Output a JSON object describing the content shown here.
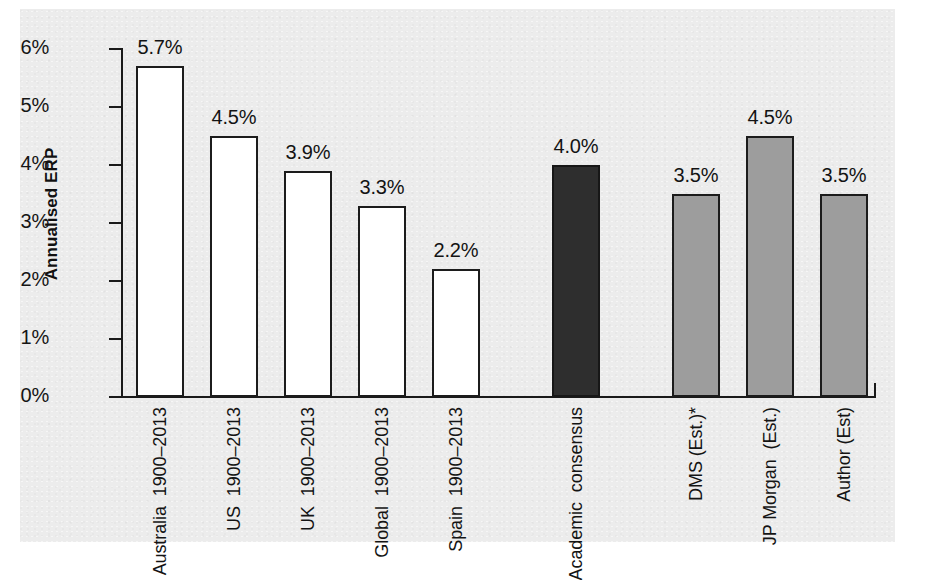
{
  "chart_data": {
    "type": "bar",
    "title": "",
    "subtitle": "",
    "xlabel": "",
    "ylabel": "Annualised ERP",
    "ylim": [
      0,
      6
    ],
    "yticks": [
      "0%",
      "1%",
      "2%",
      "3%",
      "4%",
      "5%",
      "6%"
    ],
    "ytick_values": [
      0,
      1,
      2,
      3,
      4,
      5,
      6
    ],
    "grid": false,
    "legend": "none",
    "units": "percent",
    "categories": [
      "Australia 1900–2013",
      "US 1900–2013",
      "UK 1900–2013",
      "Global 1900–2013",
      "Spain 1900–2013",
      "Academic consensus",
      "DMS (Est.)*",
      "JP Morgan (Est.)",
      "Author (Est)"
    ],
    "values": [
      5.7,
      4.5,
      3.9,
      3.3,
      2.2,
      4.0,
      3.5,
      4.5,
      3.5
    ],
    "data_labels": [
      "5.7%",
      "4.5%",
      "3.9%",
      "3.3%",
      "2.2%",
      "4.0%",
      "3.5%",
      "4.5%",
      "3.5%"
    ],
    "bars": [
      {
        "id": "australia",
        "label_lines": [
          "Australia",
          "1900–2013"
        ],
        "value": 5.7,
        "value_label": "5.7%",
        "style": "open",
        "group": "historical"
      },
      {
        "id": "us",
        "label_lines": [
          "US",
          "1900–2013"
        ],
        "value": 4.5,
        "value_label": "4.5%",
        "style": "open",
        "group": "historical"
      },
      {
        "id": "uk",
        "label_lines": [
          "UK",
          "1900–2013"
        ],
        "value": 3.9,
        "value_label": "3.9%",
        "style": "open",
        "group": "historical"
      },
      {
        "id": "global",
        "label_lines": [
          "Global",
          "1900–2013"
        ],
        "value": 3.3,
        "value_label": "3.3%",
        "style": "open",
        "group": "historical"
      },
      {
        "id": "spain",
        "label_lines": [
          "Spain",
          "1900–2013"
        ],
        "value": 2.2,
        "value_label": "2.2%",
        "style": "open",
        "group": "historical"
      },
      {
        "id": "academic-consensus",
        "label_lines": [
          "Academic",
          "consensus"
        ],
        "value": 4.0,
        "value_label": "4.0%",
        "style": "dark",
        "group": "consensus"
      },
      {
        "id": "dms-est",
        "label_lines": [
          "DMS (Est.)*"
        ],
        "value": 3.5,
        "value_label": "3.5%",
        "style": "grey",
        "group": "estimate"
      },
      {
        "id": "jp-morgan-est",
        "label_lines": [
          "JP Morgan",
          "(Est.)"
        ],
        "value": 4.5,
        "value_label": "4.5%",
        "style": "grey",
        "group": "estimate"
      },
      {
        "id": "author-est",
        "label_lines": [
          "Author (Est)"
        ],
        "value": 3.5,
        "value_label": "3.5%",
        "style": "grey",
        "group": "estimate"
      }
    ],
    "colors": {
      "open_fill": "#ffffff",
      "dark_fill": "#2e2e2e",
      "grey_fill": "#9d9d9d",
      "bar_stroke": "#1c1c1c",
      "axis": "#1a1a1a",
      "panel_background": "#ececec",
      "page_background": "#ffffff",
      "text": "#131313"
    }
  }
}
